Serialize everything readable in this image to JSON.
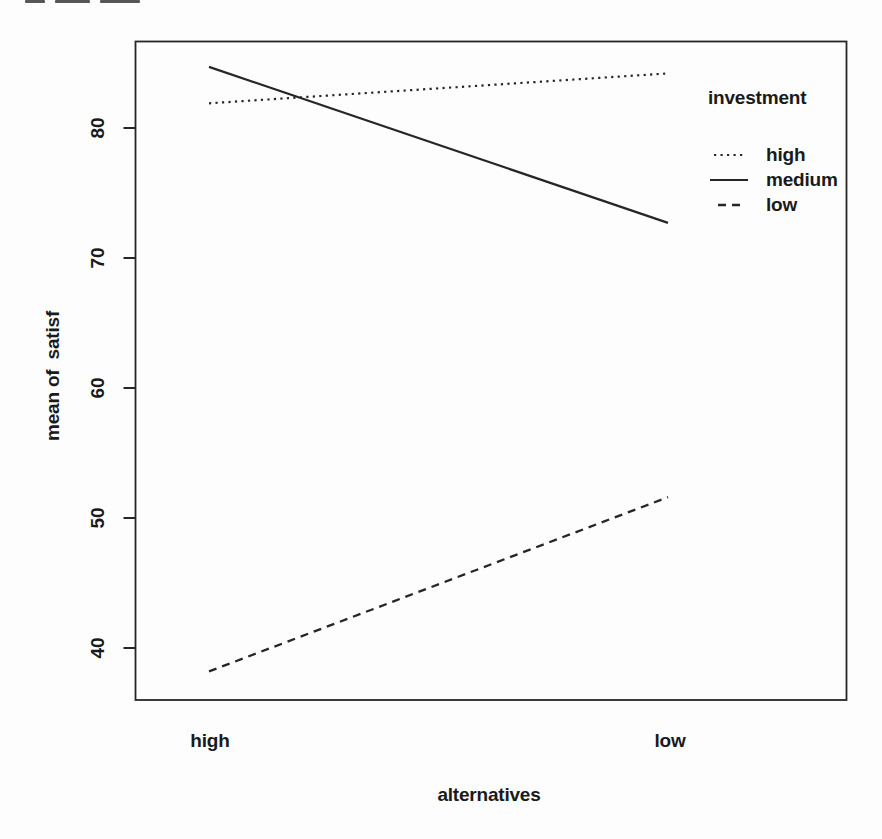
{
  "figure": {
    "background": "#fdfdfd",
    "ink": "#262626",
    "text_ink": "#1a1a1a"
  },
  "chart_data": {
    "type": "line",
    "title": "",
    "xlabel": "alternatives",
    "ylabel": "mean of  satisf",
    "categories": [
      "high",
      "low"
    ],
    "series": [
      {
        "name": "high",
        "style": "dotted",
        "values": [
          81.9,
          84.2
        ]
      },
      {
        "name": "medium",
        "style": "solid",
        "values": [
          84.7,
          72.7
        ]
      },
      {
        "name": "low",
        "style": "dashed",
        "values": [
          38.2,
          51.6
        ]
      }
    ],
    "yticks": [
      40,
      50,
      60,
      70,
      80
    ],
    "ylim": [
      36.0,
      86.6
    ],
    "grid": false,
    "legend": {
      "title": "investment",
      "position": "top-right",
      "entries": [
        "high",
        "medium",
        "low"
      ]
    }
  }
}
